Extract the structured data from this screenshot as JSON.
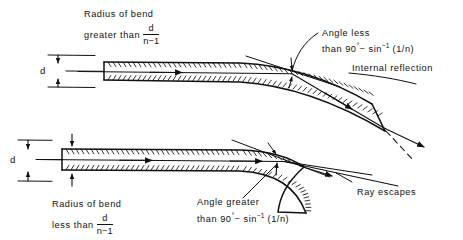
{
  "figure": {
    "type": "technical-line-diagram",
    "background": "#ffffff",
    "ink": "#111111",
    "width": 463,
    "height": 240
  },
  "top_diagram": {
    "name": "large-radius-bend-guided-ray",
    "caption": {
      "line1": "Radius of bend",
      "line2": "greater than",
      "fraction_numerator": "d",
      "fraction_denominator": "n−1"
    },
    "diameter_label": "d",
    "angle_note": {
      "line1": "Angle less",
      "line2_prefix": "than 90",
      "line2_degree": "°",
      "line2_minus": "− sin",
      "line2_sup": "−1",
      "line2_arg": "(1/n)"
    },
    "reflection_label": "Internal reflection"
  },
  "bottom_diagram": {
    "name": "small-radius-bend-escaping-ray",
    "caption": {
      "line1": "Radius of bend",
      "line2": "less than",
      "fraction_numerator": "d",
      "fraction_denominator": "n−1"
    },
    "diameter_label": "d",
    "angle_note": {
      "line1": "Angle greater",
      "line2_prefix": "than 90",
      "line2_degree": "°",
      "line2_minus": "− sin",
      "line2_sup": "−1",
      "line2_arg": "(1/n)"
    },
    "escape_label": "Ray escapes"
  }
}
